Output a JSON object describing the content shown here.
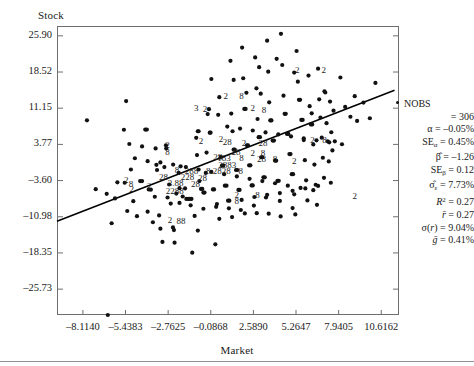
{
  "chart_data": {
    "type": "scatter",
    "title": "",
    "xlabel": "Market",
    "ylabel": "Stock",
    "grid": false,
    "legend": "none",
    "xlim": [
      -9.74,
      11.73
    ],
    "ylim": [
      -31.0,
      27.9
    ],
    "xticks": [
      "-8.1140",
      "-5.4383",
      "-2.7625",
      "-0.0868",
      "2.5890",
      "5.2647",
      "7.9405",
      "10.6162"
    ],
    "xtick_values": [
      -8.114,
      -5.4383,
      -2.7625,
      -0.0868,
      2.589,
      5.2647,
      7.9405,
      10.6162
    ],
    "yticks": [
      "25.90",
      "18.52",
      "11.15",
      "3.77",
      "-3.60",
      "-10.98",
      "-18.35",
      "-25.73"
    ],
    "ytick_values": [
      25.9,
      18.52,
      11.15,
      3.77,
      -3.6,
      -10.98,
      -18.35,
      -25.73
    ],
    "regression_line": {
      "slope": 1.26,
      "intercept": 0.37,
      "x_start": -9.74,
      "x_end": 11.45,
      "y_start": -11.9,
      "y_end": 14.8
    },
    "points": [
      [
        -7.86,
        8.67
      ],
      [
        -7.31,
        -5.35
      ],
      [
        -6.62,
        -6.3
      ],
      [
        -6.31,
        -12.3
      ],
      [
        -6.1,
        -7.25
      ],
      [
        -5.95,
        -3.95
      ],
      [
        -5.54,
        6.76
      ],
      [
        -5.49,
        -4.05
      ],
      [
        -5.4,
        12.6
      ],
      [
        -5.33,
        -9.8
      ],
      [
        -5.1,
        -1.35
      ],
      [
        -4.95,
        -7.8
      ],
      [
        -4.72,
        -10.85
      ],
      [
        -4.52,
        -3.7
      ],
      [
        -4.4,
        -3.7
      ],
      [
        -4.2,
        6.8
      ],
      [
        -4.1,
        6.8
      ],
      [
        -3.98,
        -5.4
      ],
      [
        -3.85,
        -5.45
      ],
      [
        -3.72,
        -12.1
      ],
      [
        -3.55,
        2.95
      ],
      [
        -3.5,
        -0.4
      ],
      [
        -3.46,
        -1.45
      ],
      [
        -3.33,
        -10.7
      ],
      [
        -3.25,
        -13.4
      ],
      [
        -3.12,
        -16.1
      ],
      [
        -3.0,
        -0.85
      ],
      [
        -2.9,
        3.6
      ],
      [
        -2.88,
        2.95
      ],
      [
        -2.7,
        -4.4
      ],
      [
        -2.6,
        -8.3
      ],
      [
        -2.46,
        -13.15
      ],
      [
        -2.4,
        -13.7
      ],
      [
        -2.36,
        -16.25
      ],
      [
        -2.25,
        -6.25
      ],
      [
        -2.1,
        -2.05
      ],
      [
        -2.05,
        -5.15
      ],
      [
        -1.98,
        -0.7
      ],
      [
        -1.85,
        -6.85
      ],
      [
        -1.7,
        -5.2
      ],
      [
        -1.62,
        -7.35
      ],
      [
        -1.5,
        -7.35
      ],
      [
        -1.4,
        -7.35
      ],
      [
        -1.3,
        -7.35
      ],
      [
        -1.25,
        -18.3
      ],
      [
        -1.1,
        -10.8
      ],
      [
        -1.0,
        5.1
      ],
      [
        -0.95,
        1.6
      ],
      [
        -0.9,
        6.45
      ],
      [
        -0.85,
        6.45
      ],
      [
        -0.8,
        -3.7
      ],
      [
        -0.7,
        -5.3
      ],
      [
        -0.62,
        -5.3
      ],
      [
        -0.55,
        -6.05
      ],
      [
        -0.48,
        -6.05
      ],
      [
        -0.4,
        -2.05
      ],
      [
        -0.35,
        2.1
      ],
      [
        -0.28,
        9.95
      ],
      [
        -0.2,
        10.95
      ],
      [
        -0.15,
        6.15
      ],
      [
        -0.1,
        6.15
      ],
      [
        -0.05,
        17.1
      ],
      [
        0.05,
        -5.4
      ],
      [
        0.12,
        -5.4
      ],
      [
        0.2,
        -16.6
      ],
      [
        0.3,
        -8.4
      ],
      [
        0.38,
        9.8
      ],
      [
        0.45,
        13.4
      ],
      [
        0.55,
        1.2
      ],
      [
        0.62,
        -0.55
      ],
      [
        0.7,
        -0.55
      ],
      [
        0.8,
        -4.65
      ],
      [
        0.9,
        -4.65
      ],
      [
        1.0,
        -7.7
      ],
      [
        1.08,
        -7.7
      ],
      [
        1.15,
        20.8
      ],
      [
        1.2,
        10.05
      ],
      [
        1.28,
        6.45
      ],
      [
        1.35,
        2.7
      ],
      [
        1.42,
        2.7
      ],
      [
        1.5,
        -1.45
      ],
      [
        1.58,
        -1.45
      ],
      [
        1.65,
        -5.5
      ],
      [
        1.72,
        -5.5
      ],
      [
        1.8,
        -9.6
      ],
      [
        1.88,
        23.5
      ],
      [
        1.95,
        17.25
      ],
      [
        2.02,
        11.0
      ],
      [
        2.1,
        11.0
      ],
      [
        2.18,
        3.6
      ],
      [
        2.25,
        3.6
      ],
      [
        2.32,
        -0.5
      ],
      [
        2.4,
        -0.5
      ],
      [
        2.48,
        -4.6
      ],
      [
        2.55,
        -4.6
      ],
      [
        2.62,
        -8.7
      ],
      [
        2.7,
        21.5
      ],
      [
        2.78,
        15.2
      ],
      [
        2.85,
        8.95
      ],
      [
        2.92,
        5.25
      ],
      [
        3.0,
        5.25
      ],
      [
        3.08,
        1.15
      ],
      [
        3.15,
        1.15
      ],
      [
        3.22,
        -2.95
      ],
      [
        3.3,
        -2.95
      ],
      [
        3.38,
        -7.05
      ],
      [
        3.45,
        24.9
      ],
      [
        3.52,
        18.6
      ],
      [
        3.58,
        12.35
      ],
      [
        3.65,
        8.65
      ],
      [
        3.72,
        8.65
      ],
      [
        3.8,
        4.55
      ],
      [
        3.88,
        4.55
      ],
      [
        3.95,
        0.45
      ],
      [
        4.02,
        0.45
      ],
      [
        4.1,
        -3.65
      ],
      [
        4.18,
        -3.65
      ],
      [
        4.25,
        -7.75
      ],
      [
        4.32,
        26.3
      ],
      [
        4.4,
        19.95
      ],
      [
        4.48,
        13.7
      ],
      [
        4.55,
        10.0
      ],
      [
        4.62,
        10.0
      ],
      [
        4.7,
        5.9
      ],
      [
        4.78,
        5.9
      ],
      [
        4.85,
        1.8
      ],
      [
        4.92,
        1.8
      ],
      [
        5.0,
        -2.3
      ],
      [
        5.08,
        -2.3
      ],
      [
        5.15,
        -6.4
      ],
      [
        5.22,
        -10.5
      ],
      [
        5.3,
        22.8
      ],
      [
        5.38,
        16.55
      ],
      [
        5.45,
        12.85
      ],
      [
        5.52,
        12.85
      ],
      [
        5.6,
        8.75
      ],
      [
        5.68,
        8.75
      ],
      [
        5.75,
        4.65
      ],
      [
        5.82,
        0.55
      ],
      [
        5.9,
        -3.55
      ],
      [
        5.98,
        -7.65
      ],
      [
        6.05,
        17.8
      ],
      [
        6.12,
        11.55
      ],
      [
        6.2,
        7.85
      ],
      [
        6.28,
        7.85
      ],
      [
        6.35,
        3.75
      ],
      [
        6.42,
        -0.35
      ],
      [
        6.5,
        -4.45
      ],
      [
        6.58,
        -8.55
      ],
      [
        6.65,
        19.2
      ],
      [
        6.72,
        12.95
      ],
      [
        6.8,
        9.25
      ],
      [
        6.88,
        5.15
      ],
      [
        6.95,
        1.05
      ],
      [
        7.02,
        -3.05
      ],
      [
        7.1,
        14.35
      ],
      [
        7.18,
        8.1
      ],
      [
        7.25,
        4.4
      ],
      [
        7.32,
        0.3
      ],
      [
        7.4,
        12.5
      ],
      [
        7.48,
        6.25
      ],
      [
        7.55,
        2.55
      ],
      [
        7.62,
        10.65
      ],
      [
        7.7,
        4.4
      ],
      [
        8.05,
        17.4
      ],
      [
        8.35,
        11.4
      ],
      [
        8.68,
        9.4
      ],
      [
        9.1,
        8.55
      ],
      [
        9.5,
        12.3
      ],
      [
        9.9,
        9.1
      ],
      [
        10.25,
        16.3
      ],
      [
        -6.55,
        -31.0
      ],
      [
        -4.05,
        -9.95
      ],
      [
        -0.9,
        -13.8
      ],
      [
        0.45,
        -11.4
      ],
      [
        1.25,
        -11.05
      ],
      [
        2.05,
        -10.3
      ],
      [
        2.8,
        -10.25
      ],
      [
        3.55,
        -10.35
      ],
      [
        4.3,
        -10.9
      ],
      [
        5.05,
        -9.2
      ],
      [
        -3.6,
        -6.9
      ],
      [
        -2.8,
        -7.05
      ],
      [
        -2.05,
        -8.15
      ],
      [
        -1.35,
        -8.65
      ],
      [
        -0.55,
        -9.35
      ],
      [
        0.25,
        -8.95
      ],
      [
        1.05,
        -9.25
      ],
      [
        1.85,
        -7.55
      ],
      [
        2.65,
        -6.95
      ],
      [
        3.45,
        -6.5
      ],
      [
        4.25,
        -6.15
      ],
      [
        5.05,
        -5.7
      ],
      [
        5.85,
        -5.2
      ],
      [
        6.65,
        -4.7
      ],
      [
        7.45,
        -4.05
      ],
      [
        -4.85,
        0.95
      ],
      [
        -4.05,
        0.35
      ],
      [
        -3.25,
        0.1
      ],
      [
        -2.45,
        -0.35
      ],
      [
        -1.65,
        -0.85
      ],
      [
        -0.85,
        -1.35
      ],
      [
        -0.05,
        -1.85
      ],
      [
        0.75,
        -2.3
      ],
      [
        1.55,
        -2.75
      ],
      [
        2.35,
        -3.25
      ],
      [
        3.15,
        -3.7
      ],
      [
        3.95,
        -4.15
      ],
      [
        4.75,
        -4.65
      ],
      [
        5.55,
        -5.1
      ],
      [
        6.35,
        -5.55
      ],
      [
        -5.2,
        3.85
      ],
      [
        -4.4,
        3.35
      ],
      [
        0.95,
        7.4
      ],
      [
        1.75,
        7.0
      ],
      [
        2.55,
        6.6
      ],
      [
        3.35,
        6.2
      ],
      [
        4.15,
        5.8
      ],
      [
        4.95,
        5.4
      ],
      [
        5.75,
        5.0
      ],
      [
        6.55,
        4.6
      ],
      [
        7.35,
        4.2
      ],
      [
        8.15,
        3.8
      ],
      [
        8.95,
        13.6
      ],
      [
        2.15,
        14.3
      ],
      [
        3.05,
        14.1
      ],
      [
        1.35,
        16.9
      ],
      [
        2.95,
        19.5
      ],
      [
        4.05,
        21.2
      ],
      [
        5.15,
        18.4
      ],
      [
        6.25,
        10.1
      ],
      [
        7.05,
        14.6
      ]
    ],
    "overlap_labels": [
      {
        "x": -2.8,
        "y": 3.1,
        "text": "2"
      },
      {
        "x": -2.8,
        "y": 1.55,
        "text": "8"
      },
      {
        "x": -1.0,
        "y": 10.5,
        "text": "3"
      },
      {
        "x": -0.45,
        "y": 10.45,
        "text": "2"
      },
      {
        "x": -0.7,
        "y": 3.95,
        "text": "2"
      },
      {
        "x": 0.85,
        "y": 13.1,
        "text": "2"
      },
      {
        "x": 1.85,
        "y": 13.05,
        "text": "8"
      },
      {
        "x": 2.55,
        "y": 10.55,
        "text": "2"
      },
      {
        "x": 3.25,
        "y": 10.1,
        "text": "8"
      },
      {
        "x": 5.35,
        "y": 18.4,
        "text": "2"
      },
      {
        "x": 7.0,
        "y": 18.3,
        "text": "2"
      },
      {
        "x": 0.55,
        "y": 4.2,
        "text": "2"
      },
      {
        "x": 0.95,
        "y": 3.55,
        "text": "28"
      },
      {
        "x": 2.0,
        "y": 3.45,
        "text": "2"
      },
      {
        "x": 3.2,
        "y": 3.4,
        "text": "28"
      },
      {
        "x": 1.5,
        "y": 1.6,
        "text": "28"
      },
      {
        "x": 2.55,
        "y": 1.5,
        "text": "2"
      },
      {
        "x": 3.2,
        "y": 1.5,
        "text": "8"
      },
      {
        "x": 6.3,
        "y": 4.05,
        "text": "2"
      },
      {
        "x": 7.05,
        "y": 4.0,
        "text": "8"
      },
      {
        "x": 0.35,
        "y": 0.55,
        "text": "28"
      },
      {
        "x": 0.75,
        "y": 0.4,
        "text": "183"
      },
      {
        "x": 1.85,
        "y": 0.3,
        "text": "8"
      },
      {
        "x": 3.1,
        "y": 0.25,
        "text": "28"
      },
      {
        "x": 3.95,
        "y": 0.2,
        "text": "8"
      },
      {
        "x": 5.15,
        "y": -0.15,
        "text": "2"
      },
      {
        "x": 0.95,
        "y": -1.05,
        "text": "2883"
      },
      {
        "x": -2.2,
        "y": -2.15,
        "text": "8"
      },
      {
        "x": -1.3,
        "y": -2.25,
        "text": "288"
      },
      {
        "x": -0.25,
        "y": -2.35,
        "text": "8"
      },
      {
        "x": 0.6,
        "y": -2.3,
        "text": "2828"
      },
      {
        "x": 1.8,
        "y": -2.35,
        "text": "8"
      },
      {
        "x": -3.05,
        "y": -3.45,
        "text": "28"
      },
      {
        "x": -1.55,
        "y": -3.55,
        "text": "228"
      },
      {
        "x": -0.6,
        "y": -3.6,
        "text": "28"
      },
      {
        "x": -2.3,
        "y": -4.8,
        "text": "3.88"
      },
      {
        "x": -1.05,
        "y": -4.85,
        "text": "28"
      },
      {
        "x": -3.95,
        "y": -5.3,
        "text": "2"
      },
      {
        "x": -2.35,
        "y": -6.35,
        "text": "2288"
      },
      {
        "x": 1.55,
        "y": -7.1,
        "text": "2"
      },
      {
        "x": 1.55,
        "y": -8.35,
        "text": "8"
      },
      {
        "x": 2.85,
        "y": -7.2,
        "text": "8"
      },
      {
        "x": -5.05,
        "y": -5.85,
        "text": "2"
      },
      {
        "x": -5.4,
        "y": -4.15,
        "text": "2"
      },
      {
        "x": -5.1,
        "y": -4.85,
        "text": "8"
      },
      {
        "x": -2.65,
        "y": -12.35,
        "text": "2"
      },
      {
        "x": -1.95,
        "y": -12.45,
        "text": "88"
      },
      {
        "x": 8.95,
        "y": -7.35,
        "text": "2"
      }
    ]
  },
  "stats": {
    "legend_marker_label": "NOBS",
    "rows": [
      {
        "id": "nobs",
        "label": "NOBS",
        "value": ""
      },
      {
        "id": "nobs-value",
        "label": "",
        "value": "= 306"
      },
      {
        "id": "alpha",
        "label": "α",
        "value": "= –0.05%"
      },
      {
        "id": "se-alpha",
        "label": "SEα",
        "value": "= 0.45%"
      },
      {
        "id": "beta",
        "label": "β̂",
        "value": "= –1.26"
      },
      {
        "id": "se-beta",
        "label": "SEβ",
        "value": "= 0.12"
      },
      {
        "id": "sigma-eps",
        "label": "σ̂ε",
        "value": "= 7.73%"
      },
      {
        "id": "r-squared",
        "label": "R²",
        "value": "= 0.27"
      },
      {
        "id": "r-bar",
        "label": "r̄",
        "value": "= 0.27"
      },
      {
        "id": "sigma-r",
        "label": "σ(r)",
        "value": "= 9.04%"
      },
      {
        "id": "g-bar",
        "label": "ḡ",
        "value": "= 0.41%"
      }
    ]
  },
  "colors": {
    "point": "#111111",
    "line": "#000000",
    "frame": "#6e6e6e",
    "text": "#1a1a1a",
    "rule": "#8f8f96"
  }
}
